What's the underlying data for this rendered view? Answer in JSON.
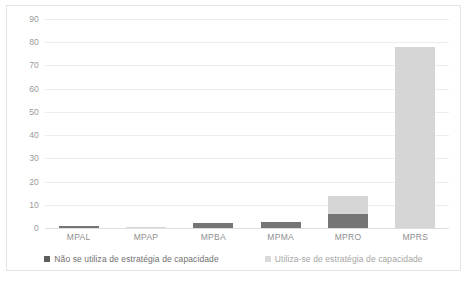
{
  "chart_data": {
    "type": "bar",
    "stacked": true,
    "title": "",
    "subtitle": "",
    "xlabel": "",
    "ylabel": "",
    "categories": [
      "MPAL",
      "MPAP",
      "MPBA",
      "MPMA",
      "MPRO",
      "MPRS"
    ],
    "series": [
      {
        "name": "Não se utiliza de estratégia de capacidade",
        "color": "#757575",
        "values": [
          1,
          0,
          2,
          2.5,
          6,
          0
        ]
      },
      {
        "name": "Utiliza-se de estratégia de capacidade",
        "color": "#d6d6d6",
        "values": [
          0,
          0.5,
          0,
          0,
          8,
          78
        ]
      }
    ],
    "ylim": [
      0,
      90
    ],
    "ytick_step": 10,
    "ytick_labels": [
      "90",
      "80",
      "70",
      "60",
      "50",
      "40",
      "30",
      "20",
      "10",
      "0"
    ],
    "grid": true,
    "legend_position": "bottom"
  },
  "legend": {
    "items": [
      {
        "label": "Não se utiliza de estratégia de capacidade",
        "swatch": "dark"
      },
      {
        "label": "Utiliza-se de estratégia de capacidade",
        "swatch": "light"
      }
    ]
  },
  "watermark": {
    "text": ""
  }
}
